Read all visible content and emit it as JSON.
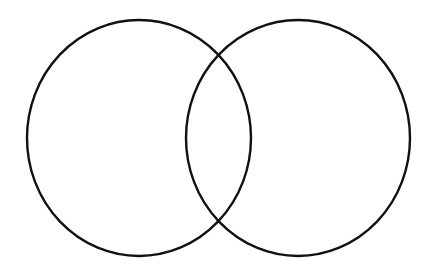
{
  "diagram": {
    "type": "venn",
    "background": "#ffffff",
    "stroke_color": "#111111",
    "stroke_width": 2.4,
    "sets": [
      {
        "id": "left-set",
        "cx": 139,
        "cy": 138,
        "rx": 112,
        "ry": 118,
        "label": ""
      },
      {
        "id": "right-set",
        "cx": 298,
        "cy": 138,
        "rx": 112,
        "ry": 118,
        "label": ""
      }
    ],
    "intersection_label": ""
  }
}
